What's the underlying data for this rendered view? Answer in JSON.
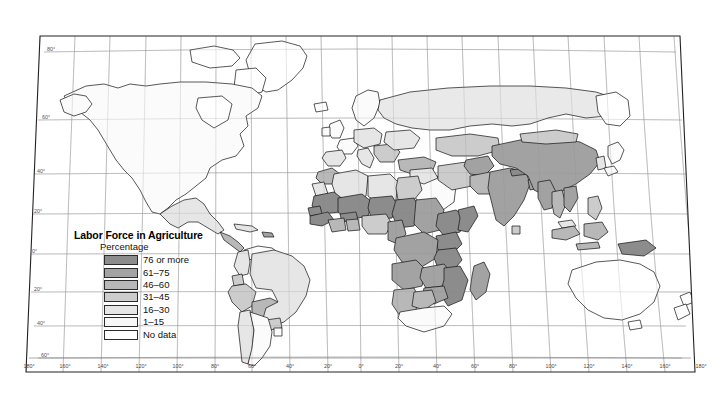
{
  "figure": {
    "kind": "choropleth-world-map",
    "projection": "robinson-like",
    "background_color": "#ffffff",
    "frame_color": "#222222",
    "graticule_color": "#8a8a8a",
    "coastline_color": "#111111"
  },
  "legend": {
    "title": "Labor Force in Agriculture",
    "subtitle": "Percentage",
    "items": [
      {
        "label": "76 or more",
        "color": "#8c8c8c"
      },
      {
        "label": "61–75",
        "color": "#a3a3a3"
      },
      {
        "label": "46–60",
        "color": "#b8b8b8"
      },
      {
        "label": "31–45",
        "color": "#cdcdcd"
      },
      {
        "label": "16–30",
        "color": "#e6e6e6"
      },
      {
        "label": "1–15",
        "color": "#f7f7f7"
      },
      {
        "label": "No data",
        "color": "#ffffff"
      }
    ]
  },
  "axes": {
    "longitude_labels": [
      "180°",
      "160°",
      "140°",
      "120°",
      "100°",
      "80°",
      "60°",
      "40°",
      "20°",
      "0°",
      "20°",
      "40°",
      "60°",
      "80°",
      "100°",
      "120°",
      "140°",
      "160°",
      "180°"
    ],
    "latitude_labels": [
      "80°",
      "60°",
      "40°",
      "20°",
      "0°",
      "20°",
      "40°",
      "60°"
    ],
    "longitude_values": [
      -180,
      -160,
      -140,
      -120,
      -100,
      -80,
      -60,
      -40,
      -20,
      0,
      20,
      40,
      60,
      80,
      100,
      120,
      140,
      160,
      180
    ],
    "latitude_values": [
      80,
      60,
      40,
      20,
      0,
      -20,
      -40,
      -60
    ]
  },
  "chart_data": {
    "type": "map",
    "title": "Labor Force in Agriculture",
    "subtitle": "Percentage",
    "classes": [
      "76 or more",
      "61–75",
      "46–60",
      "31–45",
      "16–30",
      "1–15",
      "No data"
    ],
    "regions": [
      {
        "name": "Canada",
        "class": "1–15"
      },
      {
        "name": "United States",
        "class": "1–15"
      },
      {
        "name": "Greenland",
        "class": "No data"
      },
      {
        "name": "Mexico",
        "class": "16–30"
      },
      {
        "name": "Guatemala",
        "class": "46–60"
      },
      {
        "name": "Honduras",
        "class": "31–45"
      },
      {
        "name": "Nicaragua",
        "class": "31–45"
      },
      {
        "name": "Cuba",
        "class": "16–30"
      },
      {
        "name": "Haiti",
        "class": "61–75"
      },
      {
        "name": "Colombia",
        "class": "16–30"
      },
      {
        "name": "Venezuela",
        "class": "1–15"
      },
      {
        "name": "Brazil",
        "class": "16–30"
      },
      {
        "name": "Peru",
        "class": "31–45"
      },
      {
        "name": "Bolivia",
        "class": "46–60"
      },
      {
        "name": "Ecuador",
        "class": "31–45"
      },
      {
        "name": "Paraguay",
        "class": "31–45"
      },
      {
        "name": "Chile",
        "class": "16–30"
      },
      {
        "name": "Argentina",
        "class": "1–15"
      },
      {
        "name": "United Kingdom",
        "class": "1–15"
      },
      {
        "name": "France",
        "class": "1–15"
      },
      {
        "name": "Germany",
        "class": "1–15"
      },
      {
        "name": "Spain",
        "class": "16–30"
      },
      {
        "name": "Italy",
        "class": "16–30"
      },
      {
        "name": "Poland",
        "class": "16–30"
      },
      {
        "name": "Romania",
        "class": "31–45"
      },
      {
        "name": "Turkey",
        "class": "46–60"
      },
      {
        "name": "Russia",
        "class": "16–30"
      },
      {
        "name": "Ukraine",
        "class": "16–30"
      },
      {
        "name": "Kazakhstan",
        "class": "31–45"
      },
      {
        "name": "Morocco",
        "class": "46–60"
      },
      {
        "name": "Algeria",
        "class": "16–30"
      },
      {
        "name": "Libya",
        "class": "16–30"
      },
      {
        "name": "Egypt",
        "class": "31–45"
      },
      {
        "name": "Sudan",
        "class": "61–75"
      },
      {
        "name": "Ethiopia",
        "class": "76 or more"
      },
      {
        "name": "Somalia",
        "class": "76 or more"
      },
      {
        "name": "Kenya",
        "class": "76 or more"
      },
      {
        "name": "Tanzania",
        "class": "76 or more"
      },
      {
        "name": "Nigeria",
        "class": "31–45"
      },
      {
        "name": "Niger",
        "class": "76 or more"
      },
      {
        "name": "Mali",
        "class": "76 or more"
      },
      {
        "name": "Chad",
        "class": "76 or more"
      },
      {
        "name": "Burkina Faso",
        "class": "76 or more"
      },
      {
        "name": "Senegal",
        "class": "76 or more"
      },
      {
        "name": "Ghana",
        "class": "46–60"
      },
      {
        "name": "Ivory Coast",
        "class": "46–60"
      },
      {
        "name": "Cameroon",
        "class": "61–75"
      },
      {
        "name": "DR Congo",
        "class": "61–75"
      },
      {
        "name": "Angola",
        "class": "61–75"
      },
      {
        "name": "Zambia",
        "class": "61–75"
      },
      {
        "name": "Zimbabwe",
        "class": "61–75"
      },
      {
        "name": "Mozambique",
        "class": "76 or more"
      },
      {
        "name": "Madagascar",
        "class": "61–75"
      },
      {
        "name": "South Africa",
        "class": "1–15"
      },
      {
        "name": "Namibia",
        "class": "46–60"
      },
      {
        "name": "Botswana",
        "class": "46–60"
      },
      {
        "name": "Saudi Arabia",
        "class": "1–15"
      },
      {
        "name": "Iran",
        "class": "31–45"
      },
      {
        "name": "Iraq",
        "class": "16–30"
      },
      {
        "name": "Afghanistan",
        "class": "61–75"
      },
      {
        "name": "Pakistan",
        "class": "46–60"
      },
      {
        "name": "India",
        "class": "61–75"
      },
      {
        "name": "Nepal",
        "class": "76 or more"
      },
      {
        "name": "Bangladesh",
        "class": "61–75"
      },
      {
        "name": "China",
        "class": "61–75"
      },
      {
        "name": "Mongolia",
        "class": "31–45"
      },
      {
        "name": "Myanmar",
        "class": "61–75"
      },
      {
        "name": "Thailand",
        "class": "46–60"
      },
      {
        "name": "Vietnam",
        "class": "61–75"
      },
      {
        "name": "Indonesia",
        "class": "46–60"
      },
      {
        "name": "Philippines",
        "class": "31–45"
      },
      {
        "name": "Malaysia",
        "class": "16–30"
      },
      {
        "name": "Japan",
        "class": "1–15"
      },
      {
        "name": "South Korea",
        "class": "16–30"
      },
      {
        "name": "Papua New Guinea",
        "class": "76 or more"
      },
      {
        "name": "Australia",
        "class": "1–15"
      },
      {
        "name": "New Zealand",
        "class": "1–15"
      }
    ]
  }
}
